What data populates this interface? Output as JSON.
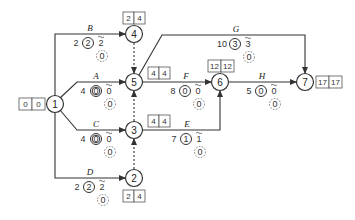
{
  "nodes": [
    {
      "id": "1",
      "label": "1",
      "times": [
        "0",
        "0"
      ]
    },
    {
      "id": "2",
      "label": "2",
      "times": [
        "2",
        "4"
      ]
    },
    {
      "id": "3",
      "label": "3",
      "times": [
        "4",
        "4"
      ]
    },
    {
      "id": "4",
      "label": "4",
      "times": [
        "2",
        "4"
      ]
    },
    {
      "id": "5",
      "label": "5",
      "times": [
        "4",
        "4"
      ]
    },
    {
      "id": "6",
      "label": "6",
      "times": [
        "12",
        "12"
      ]
    },
    {
      "id": "7",
      "label": "7",
      "times": [
        "17",
        "17"
      ]
    }
  ],
  "activities": {
    "A": {
      "name": "A",
      "duration": "4",
      "total_float": "0",
      "free_float": "0",
      "interference": "0"
    },
    "B": {
      "name": "B",
      "duration": "2",
      "total_float": "2",
      "free_float": "2",
      "interference": "0"
    },
    "C": {
      "name": "C",
      "duration": "4",
      "total_float": "0",
      "free_float": "0",
      "interference": "0"
    },
    "D": {
      "name": "D",
      "duration": "2",
      "total_float": "2",
      "free_float": "2",
      "interference": "0"
    },
    "E": {
      "name": "E",
      "duration": "7",
      "total_float": "1",
      "free_float": "1",
      "interference": "0"
    },
    "F": {
      "name": "F",
      "duration": "8",
      "total_float": "0",
      "free_float": "0",
      "interference": "0"
    },
    "G": {
      "name": "G",
      "duration": "10",
      "total_float": "3",
      "free_float": "3",
      "interference": "0"
    },
    "H": {
      "name": "H",
      "duration": "5",
      "total_float": "0",
      "free_float": "0",
      "interference": "0"
    }
  },
  "dummies": [
    {
      "from": "4",
      "to": "5"
    },
    {
      "from": "3",
      "to": "5"
    },
    {
      "from": "2",
      "to": "3"
    }
  ],
  "n1": {
    "label": "1",
    "t0": "0",
    "t1": "0"
  },
  "n2": {
    "label": "2",
    "t0": "2",
    "t1": "4"
  },
  "n3": {
    "label": "3",
    "t0": "4",
    "t1": "4"
  },
  "n4": {
    "label": "4",
    "t0": "2",
    "t1": "4"
  },
  "n5": {
    "label": "5",
    "t0": "4",
    "t1": "4"
  },
  "n6": {
    "label": "6",
    "t0": "12",
    "t1": "12"
  },
  "n7": {
    "label": "7",
    "t0": "17",
    "t1": "17"
  }
}
